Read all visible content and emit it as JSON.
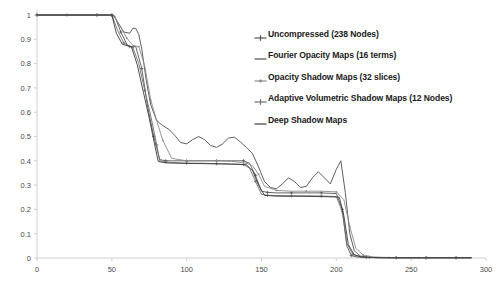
{
  "chart_data": {
    "type": "line",
    "title": "",
    "xlabel": "",
    "ylabel": "",
    "xlim": [
      0,
      300
    ],
    "ylim": [
      0,
      1
    ],
    "grid": false,
    "legend_position": "inside-top-right",
    "xticks": [
      0,
      50,
      100,
      150,
      200,
      250,
      300
    ],
    "yticks": [
      0,
      0.1,
      0.2,
      0.3,
      0.4,
      0.5,
      0.6,
      0.7,
      0.8,
      0.9,
      1
    ],
    "xtick_labels": [
      "0",
      "50",
      "100",
      "150",
      "200",
      "250",
      "300"
    ],
    "ytick_labels": [
      "0",
      "0.1",
      "0.2",
      "0.3",
      "0.4",
      "0.5",
      "0.6",
      "0.7",
      "0.8",
      "0.9",
      "1"
    ],
    "series": [
      {
        "name": "Uncompressed (238 Nodes)",
        "color": "#555555",
        "marker": "plus",
        "x": [
          0,
          10,
          20,
          30,
          40,
          48,
          50,
          52,
          56,
          60,
          62,
          66,
          70,
          74,
          78,
          82,
          86,
          90,
          100,
          110,
          120,
          130,
          138,
          142,
          146,
          150,
          154,
          160,
          170,
          180,
          190,
          200,
          204,
          207,
          210,
          214,
          220,
          230,
          240,
          250,
          260,
          270,
          280,
          290
        ],
        "y": [
          1,
          1,
          1,
          1,
          1,
          1,
          1,
          0.995,
          0.93,
          0.88,
          0.87,
          0.87,
          0.78,
          0.62,
          0.5,
          0.405,
          0.4,
          0.4,
          0.4,
          0.4,
          0.4,
          0.4,
          0.4,
          0.39,
          0.34,
          0.275,
          0.27,
          0.268,
          0.268,
          0.268,
          0.268,
          0.265,
          0.2,
          0.05,
          0.01,
          0.004,
          0.002,
          0.001,
          0.001,
          0.001,
          0.001,
          0.001,
          0.001,
          0.001
        ]
      },
      {
        "name": "Fourier Opacity Maps (16 terms)",
        "color": "#4d4d4d",
        "marker": "none",
        "x": [
          0,
          20,
          40,
          48,
          51,
          54,
          58,
          62,
          64,
          66,
          68,
          70,
          73,
          76,
          80,
          84,
          88,
          92,
          96,
          100,
          104,
          108,
          112,
          116,
          120,
          124,
          128,
          132,
          136,
          140,
          144,
          148,
          152,
          156,
          160,
          164,
          168,
          172,
          176,
          180,
          184,
          188,
          192,
          196,
          200,
          203,
          206,
          209,
          212,
          216,
          222,
          230,
          240,
          250,
          260,
          270,
          280,
          290
        ],
        "y": [
          1,
          1,
          1,
          1,
          1,
          0.97,
          0.93,
          0.925,
          0.945,
          0.945,
          0.92,
          0.86,
          0.73,
          0.63,
          0.565,
          0.545,
          0.53,
          0.505,
          0.475,
          0.47,
          0.487,
          0.5,
          0.487,
          0.463,
          0.455,
          0.47,
          0.494,
          0.497,
          0.477,
          0.455,
          0.43,
          0.375,
          0.315,
          0.29,
          0.285,
          0.305,
          0.33,
          0.315,
          0.29,
          0.295,
          0.33,
          0.355,
          0.33,
          0.305,
          0.365,
          0.4,
          0.27,
          0.1,
          0.03,
          0.008,
          0.003,
          0.002,
          0.001,
          0.001,
          0.001,
          0.001,
          0.001,
          0.001
        ]
      },
      {
        "name": "Opacity Shadow Maps (32 slices)",
        "color": "#8a8a8a",
        "marker": "dot",
        "x": [
          0,
          20,
          40,
          48,
          52,
          56,
          60,
          64,
          68,
          72,
          76,
          80,
          84,
          90,
          100,
          110,
          120,
          130,
          140,
          144,
          148,
          152,
          160,
          170,
          180,
          190,
          200,
          205,
          209,
          213,
          218,
          225,
          235,
          245,
          255,
          265,
          275,
          290
        ],
        "y": [
          1,
          1,
          1,
          1,
          0.99,
          0.95,
          0.905,
          0.875,
          0.87,
          0.79,
          0.65,
          0.565,
          0.485,
          0.41,
          0.4,
          0.4,
          0.4,
          0.398,
          0.39,
          0.38,
          0.345,
          0.295,
          0.278,
          0.275,
          0.275,
          0.275,
          0.272,
          0.24,
          0.13,
          0.04,
          0.012,
          0.004,
          0.002,
          0.001,
          0.001,
          0.001,
          0.001,
          0.001
        ]
      },
      {
        "name": "Adaptive Volumetric Shadow Maps (12 Nodes)",
        "color": "#707070",
        "marker": "plus",
        "x": [
          0,
          20,
          40,
          48,
          50,
          54,
          58,
          62,
          64,
          68,
          72,
          76,
          80,
          82,
          86,
          90,
          100,
          110,
          120,
          130,
          138,
          142,
          146,
          150,
          154,
          160,
          170,
          180,
          190,
          200,
          204,
          207,
          211,
          216,
          222,
          230,
          240,
          250,
          260,
          270,
          280,
          290
        ],
        "y": [
          1,
          1,
          1,
          1,
          1,
          0.935,
          0.885,
          0.87,
          0.868,
          0.8,
          0.69,
          0.585,
          0.465,
          0.4,
          0.395,
          0.393,
          0.39,
          0.39,
          0.388,
          0.387,
          0.385,
          0.37,
          0.315,
          0.262,
          0.258,
          0.257,
          0.256,
          0.256,
          0.255,
          0.253,
          0.19,
          0.06,
          0.015,
          0.005,
          0.002,
          0.001,
          0.001,
          0.001,
          0.001,
          0.001,
          0.001,
          0.001
        ]
      },
      {
        "name": "Deep Shadow Maps",
        "color": "#3a3a3a",
        "marker": "none",
        "x": [
          0,
          20,
          40,
          48,
          50,
          53,
          57,
          61,
          63,
          67,
          71,
          75,
          79,
          81,
          84,
          88,
          95,
          105,
          115,
          125,
          135,
          140,
          144,
          148,
          152,
          158,
          165,
          175,
          185,
          195,
          202,
          205,
          208,
          212,
          217,
          224,
          232,
          242,
          252,
          262,
          272,
          282,
          290
        ],
        "y": [
          1,
          1,
          1,
          1,
          1,
          0.925,
          0.88,
          0.872,
          0.87,
          0.795,
          0.685,
          0.575,
          0.455,
          0.398,
          0.393,
          0.391,
          0.39,
          0.389,
          0.388,
          0.387,
          0.385,
          0.383,
          0.36,
          0.3,
          0.258,
          0.255,
          0.254,
          0.254,
          0.253,
          0.252,
          0.25,
          0.175,
          0.055,
          0.013,
          0.004,
          0.002,
          0.001,
          0.001,
          0.001,
          0.001,
          0.001,
          0.001,
          0.001
        ]
      }
    ]
  },
  "legend": {
    "items": [
      {
        "label": "Uncompressed (238 Nodes)",
        "color": "#555555",
        "marker": "plus"
      },
      {
        "label": "Fourier Opacity Maps (16 terms)",
        "color": "#4d4d4d",
        "marker": "line"
      },
      {
        "label": "Opacity Shadow Maps (32 slices)",
        "color": "#8a8a8a",
        "marker": "dot"
      },
      {
        "label": "Adaptive Volumetric Shadow Maps (12 Nodes)",
        "color": "#707070",
        "marker": "plus"
      },
      {
        "label": "Deep Shadow Maps",
        "color": "#3a3a3a",
        "marker": "line"
      }
    ]
  },
  "axes": {
    "axis_color": "#d0d0d0",
    "tick_text_color": "#4a4a4a"
  }
}
